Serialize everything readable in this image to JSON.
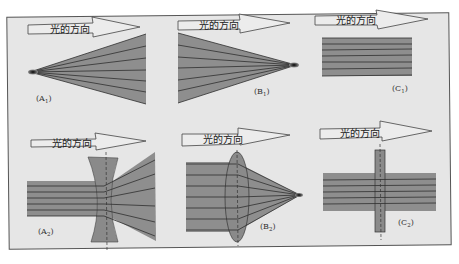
{
  "colors": {
    "page_bg": "#ffffff",
    "panel_bg": "#e6e6e6",
    "panel_border": "#555555",
    "beam_fill": "#8e8e8e",
    "ray_line": "#2e2e2e",
    "lens_fill": "#8a8a8a",
    "arrow_fill": "#ececec",
    "arrow_stroke": "#444444"
  },
  "arrow_label": "光的方向",
  "panels": [
    {
      "id": "A1",
      "label_main": "(A",
      "label_sub": "1",
      "label_end": ")",
      "description": "diverging beam from point source"
    },
    {
      "id": "B1",
      "label_main": "(B",
      "label_sub": "1",
      "label_end": ")",
      "description": "converging beam to focal point"
    },
    {
      "id": "C1",
      "label_main": "(C",
      "label_sub": "1",
      "label_end": ")",
      "description": "parallel beam"
    },
    {
      "id": "A2",
      "label_main": "(A",
      "label_sub": "2",
      "label_end": ")",
      "description": "parallel beam through concave lens diverges"
    },
    {
      "id": "B2",
      "label_main": "(B",
      "label_sub": "2",
      "label_end": ")",
      "description": "parallel beam through convex lens converges"
    },
    {
      "id": "C2",
      "label_main": "(C",
      "label_sub": "2",
      "label_end": ")",
      "description": "parallel beam through flat plate stays parallel"
    }
  ]
}
